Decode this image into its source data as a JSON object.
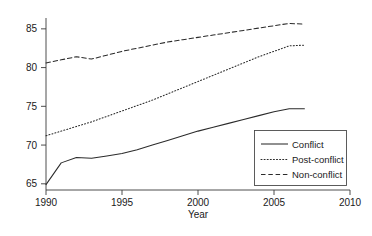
{
  "chart_data": {
    "type": "line",
    "title": "",
    "xlabel": "Year",
    "ylabel": "",
    "xlim": [
      1990,
      2010
    ],
    "ylim": [
      64.2,
      86.4
    ],
    "xticks": [
      1990,
      1995,
      2000,
      2005,
      2010
    ],
    "yticks": [
      65,
      70,
      75,
      80,
      85
    ],
    "xtick_labels": [
      "1990",
      "1995",
      "2000",
      "2005",
      "2010"
    ],
    "ytick_labels": [
      "65",
      "70",
      "75",
      "80",
      "85"
    ],
    "grid": false,
    "legend_position": "lower right",
    "x": [
      1990,
      1991,
      1992,
      1993,
      1994,
      1995,
      1996,
      1997,
      1998,
      1999,
      2000,
      2001,
      2002,
      2003,
      2004,
      2005,
      2006,
      2007
    ],
    "series": [
      {
        "name": "Conflict",
        "style": "solid",
        "color": "#2b2b2b",
        "values": [
          64.9,
          67.7,
          68.4,
          68.3,
          68.6,
          68.9,
          69.4,
          70.0,
          70.6,
          71.2,
          71.8,
          72.3,
          72.8,
          73.3,
          73.8,
          74.3,
          74.7,
          74.7
        ]
      },
      {
        "name": "Post-conflict",
        "style": "dotted",
        "color": "#2b2b2b",
        "values": [
          71.2,
          71.8,
          72.4,
          73.0,
          73.7,
          74.4,
          75.1,
          75.8,
          76.6,
          77.4,
          78.2,
          79.0,
          79.8,
          80.6,
          81.4,
          82.1,
          82.8,
          82.9
        ]
      },
      {
        "name": "Non-conflict",
        "style": "dashed",
        "color": "#2b2b2b",
        "values": [
          80.6,
          81.0,
          81.4,
          81.1,
          81.6,
          82.1,
          82.5,
          82.9,
          83.3,
          83.6,
          83.9,
          84.2,
          84.5,
          84.8,
          85.1,
          85.4,
          85.7,
          85.6
        ]
      }
    ]
  },
  "axes": {
    "x_title": "Year"
  },
  "legend": {
    "entries": [
      {
        "label": "Conflict",
        "style": "solid"
      },
      {
        "label": "Post-conflict",
        "style": "dotted"
      },
      {
        "label": "Non-conflict",
        "style": "dashed"
      }
    ]
  }
}
